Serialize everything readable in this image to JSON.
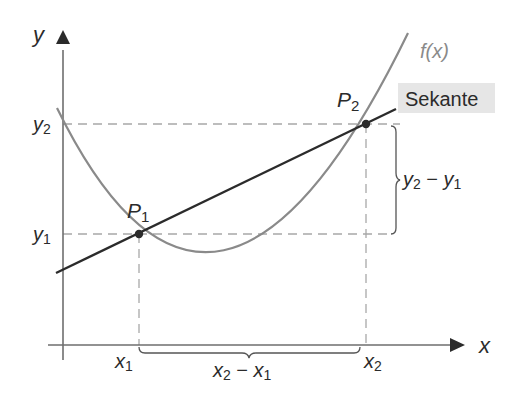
{
  "diagram": {
    "axes": {
      "x_label": "x",
      "y_label": "y"
    },
    "function_label": "f(x)",
    "secant_label": "Sekante",
    "points": [
      {
        "name": "P",
        "sub": "1",
        "x_label": "x",
        "x_sub": "1",
        "y_label": "y",
        "y_sub": "1"
      },
      {
        "name": "P",
        "sub": "2",
        "x_label": "x",
        "x_sub": "2",
        "y_label": "y",
        "y_sub": "2"
      }
    ],
    "delta_x": {
      "a": "x",
      "a_sub": "2",
      "minus": " − ",
      "b": "x",
      "b_sub": "1"
    },
    "delta_y": {
      "a": "y",
      "a_sub": "2",
      "minus": " − ",
      "b": "y",
      "b_sub": "1"
    },
    "colors": {
      "curve": "#8a8a8a",
      "secant": "#2b2b2b",
      "axis": "#6e6e6e",
      "dashed": "#a8a8a8",
      "label_box": "#e6e6e6"
    }
  }
}
